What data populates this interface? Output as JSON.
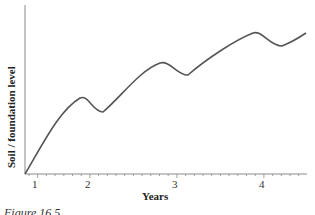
{
  "chart_data": {
    "type": "line",
    "title": "",
    "xlabel": "Years",
    "ylabel": "Soil / foundation level",
    "x_ticks": [
      "1",
      "2",
      "3",
      "4"
    ],
    "grid": false,
    "legend": null,
    "series": [
      {
        "name": "Soil / foundation level",
        "x": [
          0.9,
          1.3,
          1.9,
          2.2,
          2.8,
          3.1,
          3.8,
          4.1,
          4.5
        ],
        "values": [
          0,
          45,
          57,
          47,
          83,
          73,
          93,
          82,
          93
        ]
      }
    ],
    "ylim": [
      0,
      100
    ],
    "xlim": [
      0.85,
      4.5
    ],
    "annotations": []
  },
  "caption": "Figure 16.5",
  "colors": {
    "line": "#555555",
    "axis": "#888888"
  }
}
